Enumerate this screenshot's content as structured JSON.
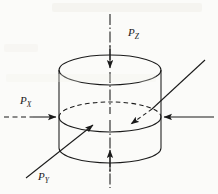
{
  "figure": {
    "background_color": "#fbfbf9",
    "line_color": "#1a1a1a",
    "labels": [
      {
        "id": "pz",
        "base": "P",
        "subscript": "Z",
        "x": 128,
        "y": 36,
        "meaning": "axial pressure along vertical Z axis"
      },
      {
        "id": "px",
        "base": "P",
        "subscript": "X",
        "x": 20,
        "y": 104,
        "meaning": "lateral pressure along X axis"
      },
      {
        "id": "py",
        "base": "P",
        "subscript": "Y",
        "x": 38,
        "y": 180,
        "meaning": "lateral pressure along Y axis"
      }
    ],
    "axes": [
      {
        "name": "z-axis",
        "style": "dash-dot",
        "orientation": "vertical"
      },
      {
        "name": "x-axis",
        "style": "solid-and-dashed",
        "orientation": "horizontal"
      },
      {
        "name": "y-axis",
        "style": "solid",
        "orientation": "diagonal"
      }
    ],
    "arrows": [
      {
        "name": "pz-top-arrow",
        "direction": "down"
      },
      {
        "name": "pz-bottom-arrow",
        "direction": "up"
      },
      {
        "name": "px-left-arrow",
        "direction": "right"
      },
      {
        "name": "px-right-arrow",
        "direction": "left"
      },
      {
        "name": "py-front-arrow",
        "direction": "up-right"
      },
      {
        "name": "py-back-arrow",
        "direction": "down-left"
      }
    ],
    "solid_geometry": {
      "shape": "cylinder",
      "top_ellipse": {
        "cx": 110,
        "cy": 70,
        "rx": 51,
        "ry": 15
      },
      "mid_ellipse": {
        "cx": 110,
        "cy": 117,
        "rx": 51,
        "ry": 15
      },
      "bottom_ellipse": {
        "cx": 110,
        "cy": 148,
        "rx": 51,
        "ry": 15
      },
      "hidden_line_style": "dashed"
    }
  }
}
